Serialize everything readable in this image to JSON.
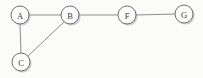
{
  "diagram": {
    "type": "node-link-graph",
    "width": 203,
    "height": 78,
    "background_color": "#fbfbfa",
    "node_fill_color": "#fdfdfd",
    "node_stroke_color": "#6f6f6f",
    "node_shadow_color": "#a9a9a9",
    "edge_color": "#8d8d8d",
    "label_color": "#3b3b3b",
    "node_radius": 9,
    "nodes": [
      {
        "id": "A",
        "label": "A",
        "cx": 20,
        "cy": 15
      },
      {
        "id": "B",
        "label": "B",
        "cx": 70,
        "cy": 15
      },
      {
        "id": "F",
        "label": "F",
        "cx": 127,
        "cy": 15
      },
      {
        "id": "G",
        "label": "G",
        "cx": 184,
        "cy": 14
      },
      {
        "id": "C",
        "label": "C",
        "cx": 21,
        "cy": 62
      }
    ],
    "edges": [
      {
        "id": "A-B",
        "source": "A",
        "target": "B",
        "x1": 29,
        "y1": 15,
        "x2": 61,
        "y2": 15
      },
      {
        "id": "B-F",
        "source": "B",
        "target": "F",
        "x1": 79,
        "y1": 15,
        "x2": 118,
        "y2": 15
      },
      {
        "id": "F-G",
        "source": "F",
        "target": "G",
        "x1": 136,
        "y1": 15,
        "x2": 175,
        "y2": 14
      },
      {
        "id": "A-C",
        "source": "A",
        "target": "C",
        "x1": 20,
        "y1": 24,
        "x2": 21,
        "y2": 53
      },
      {
        "id": "B-C",
        "source": "B",
        "target": "C",
        "x1": 64,
        "y1": 22,
        "x2": 28,
        "y2": 56
      }
    ]
  }
}
